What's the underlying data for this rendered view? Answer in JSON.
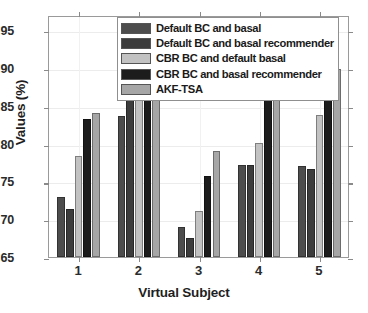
{
  "chart_data": {
    "type": "bar",
    "title": "",
    "xlabel": "Virtual Subject",
    "ylabel": "Values (%)",
    "categories": [
      "1",
      "2",
      "3",
      "4",
      "5"
    ],
    "ylim": [
      65,
      97
    ],
    "yticks": [
      65,
      70,
      75,
      80,
      85,
      90,
      95
    ],
    "grid": true,
    "legend_position": "top-center",
    "series": [
      {
        "name": "Default BC and basal",
        "color": "#4d4d4d",
        "values": [
          73.0,
          83.7,
          69.0,
          77.2,
          77.1
        ]
      },
      {
        "name": "Default BC and basal recommender",
        "color": "#3c3c3c",
        "values": [
          71.3,
          87.0,
          67.5,
          77.2,
          76.7
        ]
      },
      {
        "name": "CBR BC and default basal",
        "color": "#c2c2c2",
        "values": [
          78.4,
          87.2,
          71.1,
          80.1,
          83.8
        ]
      },
      {
        "name": "CBR BC and basal recommender",
        "color": "#1c1c1c",
        "values": [
          83.3,
          91.3,
          75.7,
          85.8,
          87.7
        ]
      },
      {
        "name": "AKF-TSA",
        "color": "#a6a6a6",
        "values": [
          84.0,
          92.6,
          79.0,
          88.5,
          89.9
        ]
      }
    ]
  },
  "axes": {
    "ytick_labels": [
      "65",
      "70",
      "75",
      "80",
      "85",
      "90",
      "95"
    ],
    "xtick_labels": [
      "1",
      "2",
      "3",
      "4",
      "5"
    ]
  }
}
